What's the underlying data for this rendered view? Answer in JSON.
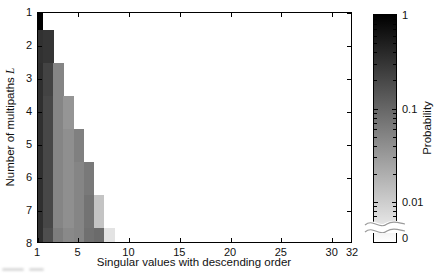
{
  "chart_data": {
    "type": "heatmap",
    "title": "",
    "xlabel": "Singular values with descending order",
    "ylabel": "Number of multipaths L",
    "ylabel_prefix": "Number of multipaths",
    "ylabel_var": "L",
    "colorbar_label": "Probability",
    "colorbar_scale": "log",
    "colormap": "inverted-gray (1 = black, 0 = white)",
    "colorbar_tick_labels": [
      "1",
      "0.1",
      "0.01",
      "0"
    ],
    "colorbar_major_ticks": [
      1,
      0.1,
      0.01
    ],
    "colorbar_has_axis_break_to_zero": true,
    "xlim": [
      1,
      32
    ],
    "ylim": [
      1,
      8
    ],
    "x_ticks": [
      1,
      5,
      10,
      15,
      20,
      25,
      30,
      32
    ],
    "y_ticks": [
      1,
      2,
      3,
      4,
      5,
      6,
      7,
      8
    ],
    "grid": false,
    "legend_position": "colorbar-right",
    "rows": [
      {
        "L": 1,
        "probabilities": [
          1.0
        ]
      },
      {
        "L": 2,
        "probabilities": [
          0.33,
          0.3
        ]
      },
      {
        "L": 3,
        "probabilities": [
          0.35,
          0.22,
          0.05
        ]
      },
      {
        "L": 4,
        "probabilities": [
          0.35,
          0.2,
          0.05,
          0.035
        ]
      },
      {
        "L": 5,
        "probabilities": [
          0.35,
          0.2,
          0.05,
          0.04,
          0.055
        ]
      },
      {
        "L": 6,
        "probabilities": [
          0.35,
          0.2,
          0.05,
          0.04,
          0.05,
          0.065
        ]
      },
      {
        "L": 7,
        "probabilities": [
          0.35,
          0.2,
          0.05,
          0.04,
          0.05,
          0.075,
          0.012
        ]
      },
      {
        "L": 8,
        "probabilities": [
          0.35,
          0.17,
          0.06,
          0.045,
          0.05,
          0.08,
          0.09,
          0.006
        ]
      }
    ]
  },
  "colors": {
    "background": "#ffffff",
    "axis": "#000000",
    "text": "#111111",
    "break_line": "#999999"
  }
}
